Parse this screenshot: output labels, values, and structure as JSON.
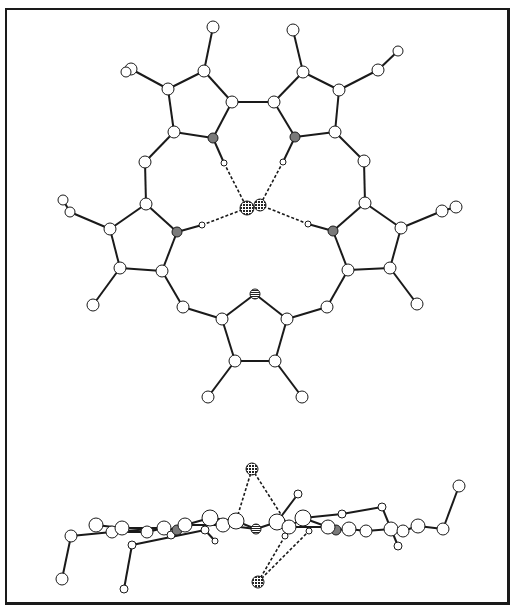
{
  "figure": {
    "colors": {
      "frame": "#1a1a1a",
      "bond": "#1a1a1a",
      "atom_fill": "#ffffff",
      "nitrogen_fill": "#7a7a7a",
      "chloride_fill": "#3a3a3a",
      "hbond": "#1a1a1a"
    }
  },
  "top_view": {
    "atoms": [
      {
        "id": "A1",
        "x": 213,
        "y": 27,
        "r": 6,
        "type": "C"
      },
      {
        "id": "A2",
        "x": 204,
        "y": 71,
        "r": 6,
        "type": "C"
      },
      {
        "id": "A3",
        "x": 168,
        "y": 89,
        "r": 6,
        "type": "C"
      },
      {
        "id": "A4",
        "x": 131,
        "y": 69,
        "r": 6,
        "type": "C"
      },
      {
        "id": "A5",
        "x": 126,
        "y": 72,
        "r": 5,
        "type": "C"
      },
      {
        "id": "A6",
        "x": 174,
        "y": 132,
        "r": 6,
        "type": "C"
      },
      {
        "id": "A7",
        "x": 213,
        "y": 138,
        "r": 5,
        "type": "N"
      },
      {
        "id": "A8",
        "x": 232,
        "y": 102,
        "r": 6,
        "type": "C"
      },
      {
        "id": "A9",
        "x": 145,
        "y": 162,
        "r": 6,
        "type": "C"
      },
      {
        "id": "A10",
        "x": 224,
        "y": 163,
        "r": 3,
        "type": "H"
      },
      {
        "id": "B1",
        "x": 293,
        "y": 30,
        "r": 6,
        "type": "C"
      },
      {
        "id": "B2",
        "x": 303,
        "y": 72,
        "r": 6,
        "type": "C"
      },
      {
        "id": "B3",
        "x": 339,
        "y": 90,
        "r": 6,
        "type": "C"
      },
      {
        "id": "B4",
        "x": 378,
        "y": 70,
        "r": 6,
        "type": "C"
      },
      {
        "id": "B5",
        "x": 398,
        "y": 51,
        "r": 5,
        "type": "C"
      },
      {
        "id": "B6",
        "x": 274,
        "y": 102,
        "r": 6,
        "type": "C"
      },
      {
        "id": "B7",
        "x": 295,
        "y": 137,
        "r": 5,
        "type": "N"
      },
      {
        "id": "B8",
        "x": 335,
        "y": 132,
        "r": 6,
        "type": "C"
      },
      {
        "id": "B9",
        "x": 364,
        "y": 161,
        "r": 6,
        "type": "C"
      },
      {
        "id": "B10",
        "x": 283,
        "y": 162,
        "r": 3,
        "type": "H"
      },
      {
        "id": "C1",
        "x": 146,
        "y": 204,
        "r": 6,
        "type": "C"
      },
      {
        "id": "C2",
        "x": 110,
        "y": 229,
        "r": 6,
        "type": "C"
      },
      {
        "id": "C3",
        "x": 70,
        "y": 212,
        "r": 5,
        "type": "C"
      },
      {
        "id": "C4",
        "x": 63,
        "y": 200,
        "r": 5,
        "type": "C"
      },
      {
        "id": "C5",
        "x": 177,
        "y": 232,
        "r": 5,
        "type": "N"
      },
      {
        "id": "C6",
        "x": 202,
        "y": 225,
        "r": 3,
        "type": "H"
      },
      {
        "id": "C7",
        "x": 120,
        "y": 268,
        "r": 6,
        "type": "C"
      },
      {
        "id": "C8",
        "x": 162,
        "y": 271,
        "r": 6,
        "type": "C"
      },
      {
        "id": "C9",
        "x": 93,
        "y": 305,
        "r": 6,
        "type": "C"
      },
      {
        "id": "C10",
        "x": 183,
        "y": 307,
        "r": 6,
        "type": "C"
      },
      {
        "id": "D1",
        "x": 365,
        "y": 203,
        "r": 6,
        "type": "C"
      },
      {
        "id": "D2",
        "x": 401,
        "y": 228,
        "r": 6,
        "type": "C"
      },
      {
        "id": "D3",
        "x": 442,
        "y": 211,
        "r": 6,
        "type": "C"
      },
      {
        "id": "D4",
        "x": 456,
        "y": 207,
        "r": 6,
        "type": "C"
      },
      {
        "id": "D5",
        "x": 333,
        "y": 231,
        "r": 5,
        "type": "N"
      },
      {
        "id": "D6",
        "x": 308,
        "y": 224,
        "r": 3,
        "type": "H"
      },
      {
        "id": "D7",
        "x": 348,
        "y": 270,
        "r": 6,
        "type": "C"
      },
      {
        "id": "D8",
        "x": 390,
        "y": 268,
        "r": 6,
        "type": "C"
      },
      {
        "id": "D9",
        "x": 417,
        "y": 304,
        "r": 6,
        "type": "C"
      },
      {
        "id": "D10",
        "x": 327,
        "y": 307,
        "r": 6,
        "type": "C"
      },
      {
        "id": "E1",
        "x": 255,
        "y": 294,
        "r": 5,
        "type": "Nstriped"
      },
      {
        "id": "E2",
        "x": 222,
        "y": 319,
        "r": 6,
        "type": "C"
      },
      {
        "id": "E3",
        "x": 287,
        "y": 319,
        "r": 6,
        "type": "C"
      },
      {
        "id": "E4",
        "x": 235,
        "y": 361,
        "r": 6,
        "type": "C"
      },
      {
        "id": "E5",
        "x": 275,
        "y": 361,
        "r": 6,
        "type": "C"
      },
      {
        "id": "E6",
        "x": 208,
        "y": 397,
        "r": 6,
        "type": "C"
      },
      {
        "id": "E7",
        "x": 302,
        "y": 397,
        "r": 6,
        "type": "C"
      },
      {
        "id": "Cl1",
        "x": 247,
        "y": 208,
        "r": 7,
        "type": "Cl"
      },
      {
        "id": "Cl2",
        "x": 260,
        "y": 205,
        "r": 6,
        "type": "Cl"
      }
    ],
    "bonds": [
      [
        "A1",
        "A2"
      ],
      [
        "A2",
        "A3"
      ],
      [
        "A3",
        "A4"
      ],
      [
        "A4",
        "A5"
      ],
      [
        "A3",
        "A6"
      ],
      [
        "A6",
        "A7"
      ],
      [
        "A7",
        "A8"
      ],
      [
        "A8",
        "A2"
      ],
      [
        "A6",
        "A9"
      ],
      [
        "A7",
        "A10"
      ],
      [
        "A8",
        "B6"
      ],
      [
        "B1",
        "B2"
      ],
      [
        "B2",
        "B3"
      ],
      [
        "B3",
        "B4"
      ],
      [
        "B4",
        "B5"
      ],
      [
        "B2",
        "B6"
      ],
      [
        "B6",
        "B7"
      ],
      [
        "B7",
        "B8"
      ],
      [
        "B8",
        "B3"
      ],
      [
        "B8",
        "B9"
      ],
      [
        "B7",
        "B10"
      ],
      [
        "A9",
        "C1"
      ],
      [
        "C1",
        "C2"
      ],
      [
        "C2",
        "C3"
      ],
      [
        "C3",
        "C4"
      ],
      [
        "C1",
        "C5"
      ],
      [
        "C5",
        "C6"
      ],
      [
        "C2",
        "C7"
      ],
      [
        "C7",
        "C8"
      ],
      [
        "C8",
        "C5"
      ],
      [
        "C7",
        "C9"
      ],
      [
        "C8",
        "C10"
      ],
      [
        "B9",
        "D1"
      ],
      [
        "D1",
        "D2"
      ],
      [
        "D2",
        "D3"
      ],
      [
        "D3",
        "D4"
      ],
      [
        "D1",
        "D5"
      ],
      [
        "D5",
        "D6"
      ],
      [
        "D2",
        "D8"
      ],
      [
        "D8",
        "D7"
      ],
      [
        "D7",
        "D5"
      ],
      [
        "D8",
        "D9"
      ],
      [
        "D7",
        "D10"
      ],
      [
        "C10",
        "E2"
      ],
      [
        "D10",
        "E3"
      ],
      [
        "E1",
        "E2"
      ],
      [
        "E1",
        "E3"
      ],
      [
        "E2",
        "E4"
      ],
      [
        "E4",
        "E5"
      ],
      [
        "E5",
        "E3"
      ],
      [
        "E4",
        "E6"
      ],
      [
        "E5",
        "E7"
      ]
    ],
    "hbonds": [
      [
        "A10",
        "Cl1"
      ],
      [
        "B10",
        "Cl2"
      ],
      [
        "C6",
        "Cl1"
      ],
      [
        "D6",
        "Cl2"
      ]
    ]
  },
  "side_view": {
    "atoms": [
      {
        "id": "s1",
        "x": 62,
        "y": 579,
        "r": 6,
        "type": "C"
      },
      {
        "id": "s2",
        "x": 71,
        "y": 536,
        "r": 6,
        "type": "C"
      },
      {
        "id": "s3",
        "x": 96,
        "y": 525,
        "r": 7,
        "type": "C"
      },
      {
        "id": "s4",
        "x": 112,
        "y": 532,
        "r": 6,
        "type": "C"
      },
      {
        "id": "s5",
        "x": 122,
        "y": 528,
        "r": 7,
        "type": "C"
      },
      {
        "id": "s6",
        "x": 147,
        "y": 532,
        "r": 6,
        "type": "C"
      },
      {
        "id": "s7",
        "x": 124,
        "y": 589,
        "r": 4,
        "type": "C"
      },
      {
        "id": "s8",
        "x": 132,
        "y": 545,
        "r": 4,
        "type": "C"
      },
      {
        "id": "s9",
        "x": 164,
        "y": 528,
        "r": 7,
        "type": "C"
      },
      {
        "id": "s10",
        "x": 171,
        "y": 535,
        "r": 4,
        "type": "H"
      },
      {
        "id": "s11",
        "x": 177,
        "y": 530,
        "r": 5,
        "type": "N"
      },
      {
        "id": "s12",
        "x": 185,
        "y": 525,
        "r": 7,
        "type": "C"
      },
      {
        "id": "s13",
        "x": 205,
        "y": 530,
        "r": 4,
        "type": "H"
      },
      {
        "id": "s14",
        "x": 215,
        "y": 541,
        "r": 3,
        "type": "H"
      },
      {
        "id": "s15",
        "x": 210,
        "y": 518,
        "r": 8,
        "type": "C"
      },
      {
        "id": "s16",
        "x": 223,
        "y": 525,
        "r": 7,
        "type": "C"
      },
      {
        "id": "s17",
        "x": 236,
        "y": 521,
        "r": 8,
        "type": "C"
      },
      {
        "id": "s18",
        "x": 256,
        "y": 529,
        "r": 5,
        "type": "Nstriped"
      },
      {
        "id": "s19",
        "x": 277,
        "y": 522,
        "r": 8,
        "type": "C"
      },
      {
        "id": "s20",
        "x": 289,
        "y": 527,
        "r": 7,
        "type": "C"
      },
      {
        "id": "s21",
        "x": 285,
        "y": 536,
        "r": 3,
        "type": "H"
      },
      {
        "id": "s22",
        "x": 298,
        "y": 494,
        "r": 4,
        "type": "C"
      },
      {
        "id": "s23",
        "x": 303,
        "y": 518,
        "r": 8,
        "type": "C"
      },
      {
        "id": "s24",
        "x": 309,
        "y": 531,
        "r": 3,
        "type": "H"
      },
      {
        "id": "s25",
        "x": 336,
        "y": 530,
        "r": 5,
        "type": "N"
      },
      {
        "id": "s26",
        "x": 328,
        "y": 527,
        "r": 7,
        "type": "C"
      },
      {
        "id": "s27",
        "x": 342,
        "y": 514,
        "r": 4,
        "type": "C"
      },
      {
        "id": "s28",
        "x": 349,
        "y": 529,
        "r": 7,
        "type": "C"
      },
      {
        "id": "s29",
        "x": 366,
        "y": 531,
        "r": 6,
        "type": "C"
      },
      {
        "id": "s30",
        "x": 382,
        "y": 507,
        "r": 4,
        "type": "C"
      },
      {
        "id": "s31",
        "x": 391,
        "y": 529,
        "r": 7,
        "type": "C"
      },
      {
        "id": "s32",
        "x": 398,
        "y": 546,
        "r": 4,
        "type": "C"
      },
      {
        "id": "s33",
        "x": 403,
        "y": 531,
        "r": 6,
        "type": "C"
      },
      {
        "id": "s34",
        "x": 418,
        "y": 526,
        "r": 7,
        "type": "C"
      },
      {
        "id": "s35",
        "x": 443,
        "y": 529,
        "r": 6,
        "type": "C"
      },
      {
        "id": "s36",
        "x": 459,
        "y": 486,
        "r": 6,
        "type": "C"
      },
      {
        "id": "Cl_up",
        "x": 252,
        "y": 469,
        "r": 6,
        "type": "Cl"
      },
      {
        "id": "Cl_dn",
        "x": 258,
        "y": 582,
        "r": 6,
        "type": "Cl"
      }
    ],
    "bonds": [
      [
        "s1",
        "s2"
      ],
      [
        "s2",
        "s4"
      ],
      [
        "s3",
        "s5"
      ],
      [
        "s4",
        "s6"
      ],
      [
        "s5",
        "s9"
      ],
      [
        "s6",
        "s9"
      ],
      [
        "s7",
        "s8"
      ],
      [
        "s8",
        "s13"
      ],
      [
        "s9",
        "s11"
      ],
      [
        "s11",
        "s12"
      ],
      [
        "s12",
        "s15"
      ],
      [
        "s12",
        "s16"
      ],
      [
        "s13",
        "s14"
      ],
      [
        "s15",
        "s17"
      ],
      [
        "s16",
        "s18"
      ],
      [
        "s17",
        "s18"
      ],
      [
        "s18",
        "s19"
      ],
      [
        "s19",
        "s20"
      ],
      [
        "s19",
        "s22"
      ],
      [
        "s20",
        "s23"
      ],
      [
        "s23",
        "s27"
      ],
      [
        "s27",
        "s30"
      ],
      [
        "s30",
        "s31"
      ],
      [
        "s23",
        "s26"
      ],
      [
        "s26",
        "s25"
      ],
      [
        "s25",
        "s28"
      ],
      [
        "s28",
        "s29"
      ],
      [
        "s29",
        "s31"
      ],
      [
        "s31",
        "s33"
      ],
      [
        "s31",
        "s32"
      ],
      [
        "s33",
        "s34"
      ],
      [
        "s34",
        "s35"
      ],
      [
        "s35",
        "s36"
      ],
      [
        "s20",
        "s26"
      ],
      [
        "s4",
        "s9"
      ]
    ],
    "hbonds": [
      [
        "Cl_up",
        "s17"
      ],
      [
        "Cl_up",
        "s20"
      ],
      [
        "Cl_dn",
        "s21"
      ],
      [
        "Cl_dn",
        "s24"
      ]
    ]
  }
}
